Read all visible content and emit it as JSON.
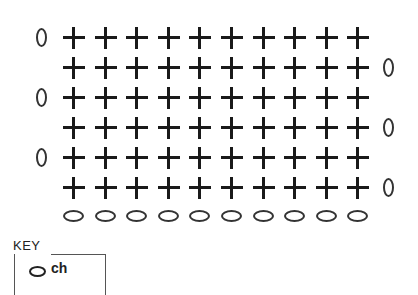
{
  "diagram": {
    "type": "crochet-stitch-chart",
    "rows": [
      {
        "row": 6,
        "stitches": 10,
        "symbol": "single-crochet",
        "turning_chain_side": "left",
        "turning_chain_label": "0"
      },
      {
        "row": 5,
        "stitches": 10,
        "symbol": "single-crochet",
        "turning_chain_side": "right",
        "turning_chain_label": "0"
      },
      {
        "row": 4,
        "stitches": 10,
        "symbol": "single-crochet",
        "turning_chain_side": "left",
        "turning_chain_label": "0"
      },
      {
        "row": 3,
        "stitches": 10,
        "symbol": "single-crochet",
        "turning_chain_side": "right",
        "turning_chain_label": "0"
      },
      {
        "row": 2,
        "stitches": 10,
        "symbol": "single-crochet",
        "turning_chain_side": "left",
        "turning_chain_label": "0"
      },
      {
        "row": 1,
        "stitches": 10,
        "symbol": "single-crochet",
        "turning_chain_side": "right",
        "turning_chain_label": "0"
      }
    ],
    "foundation_chain": {
      "count": 10,
      "symbol": "chain"
    },
    "columns": 10
  },
  "key": {
    "title": "KEY",
    "items": [
      {
        "symbol": "oval",
        "label": "ch"
      }
    ]
  }
}
